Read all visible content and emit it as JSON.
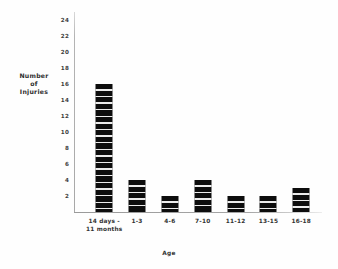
{
  "chart_data": {
    "type": "bar",
    "title": "",
    "xlabel": "Age",
    "ylabel": "Number of Injuries",
    "ylabel_lines": [
      "Number",
      "of",
      "Injuries"
    ],
    "categories": [
      "14 days - 11 months",
      "1-3",
      "4-6",
      "7-10",
      "11-12",
      "13-15",
      "16-18"
    ],
    "category_lines": [
      [
        "14 days -",
        "11 months"
      ],
      [
        "1-3"
      ],
      [
        "4-6"
      ],
      [
        "7-10"
      ],
      [
        "11-12"
      ],
      [
        "13-15"
      ],
      [
        "16-18"
      ]
    ],
    "values": [
      16,
      4,
      2,
      4,
      2,
      2,
      3
    ],
    "ylim": [
      0,
      25
    ],
    "ytick_values": [
      2,
      4,
      6,
      8,
      10,
      12,
      14,
      16,
      18,
      20,
      22,
      24
    ],
    "ytick_labels": [
      "2",
      "4",
      "6",
      "8",
      "10",
      "12",
      "14",
      "16",
      "18",
      "20",
      "22",
      "24"
    ],
    "grid": false,
    "legend": false,
    "bar_color": "#0d0d0d",
    "axis_color": "#a8a8a8",
    "background_color": "#fefefe"
  }
}
